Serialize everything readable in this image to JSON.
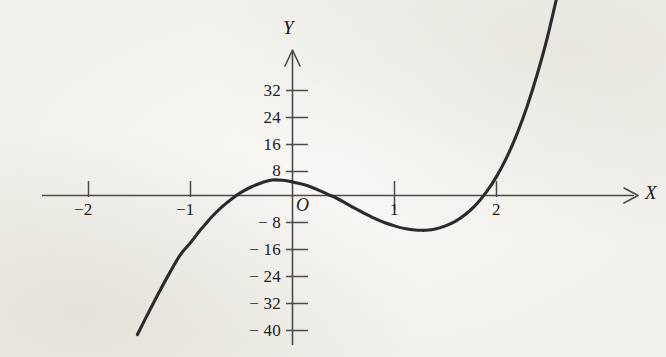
{
  "figure": {
    "background_color": "#f3f1ec",
    "curve_color": "#2b2b2b",
    "axis_color": "#4a4a4a",
    "text_color": "#1b1b1b"
  },
  "axis_labels": {
    "y": "Y",
    "x": "X",
    "origin": "O"
  },
  "chart_data": {
    "type": "line",
    "title": "",
    "subtitle": "",
    "xlabel": "X",
    "ylabel": "Y",
    "origin_label": "O",
    "xlim": [
      -2.15,
      3.65
    ],
    "ylim": [
      -44,
      36
    ],
    "grid": false,
    "legend": null,
    "annotations": [],
    "x_ticks": [
      -2,
      -1,
      1,
      2
    ],
    "x_tick_labels": [
      "−2",
      "−1",
      "1",
      "2"
    ],
    "y_ticks": [
      32,
      24,
      16,
      8,
      -8,
      -16,
      -24,
      -32,
      -40
    ],
    "y_tick_labels": [
      "32",
      "24",
      "16",
      "8",
      "− 8",
      "− 16",
      "− 24",
      "− 32",
      "− 40"
    ],
    "series": [
      {
        "name": "cubic",
        "equation": "y = 8x^3 - 12x^2 - 6x + 4",
        "x_range": [
          -1.52,
          2.63
        ],
        "roots": [
          -0.85,
          0.37,
          2.0
        ],
        "local_maximum": {
          "x": -0.27,
          "y": 7.0
        },
        "local_minimum": {
          "x": 1.27,
          "y": -5.2
        },
        "x": [
          -1.52,
          -1.4,
          -1.3,
          -1.2,
          -1.1,
          -1.0,
          -0.9,
          -0.85,
          -0.8,
          -0.7,
          -0.6,
          -0.5,
          -0.4,
          -0.3,
          -0.27,
          -0.2,
          -0.1,
          0.0,
          0.1,
          0.2,
          0.3,
          0.37,
          0.4,
          0.5,
          0.6,
          0.7,
          0.8,
          0.9,
          1.0,
          1.1,
          1.2,
          1.27,
          1.3,
          1.4,
          1.5,
          1.6,
          1.7,
          1.8,
          1.9,
          2.0,
          2.1,
          2.2,
          2.3,
          2.4,
          2.5,
          2.63
        ],
        "y": [
          -41.2,
          -34.0,
          -28.2,
          -22.7,
          -17.6,
          -14.0,
          -10.1,
          -8.4,
          -6.6,
          -3.6,
          -1.1,
          1.0,
          2.6,
          3.8,
          4.1,
          4.6,
          4.5,
          4.0,
          3.3,
          2.3,
          1.0,
          0.0,
          -0.3,
          -1.9,
          -3.6,
          -5.2,
          -6.7,
          -8.0,
          -9.0,
          -9.8,
          -10.2,
          -10.3,
          -10.3,
          -9.9,
          -9.0,
          -7.6,
          -5.5,
          -2.7,
          1.0,
          5.6,
          11.3,
          18.2,
          26.4,
          36.0,
          47.0,
          63.8
        ],
        "visible_pixel_curve": true
      }
    ]
  }
}
